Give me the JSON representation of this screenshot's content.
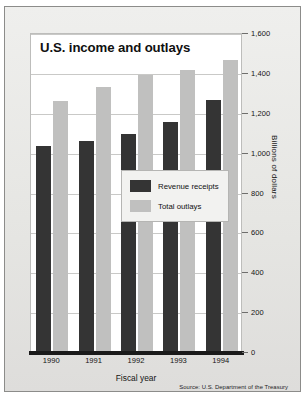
{
  "card": {
    "title": "U.S. income and outlays",
    "source_note": "Source: U.S. Department of the Treasury"
  },
  "axes": {
    "x_label": "Fiscal year",
    "y_label": "Billions of dollars",
    "y_ticks": [
      "0",
      "200",
      "400",
      "600",
      "800",
      "1,000",
      "1,200",
      "1,400",
      "1,600"
    ],
    "x_ticks": [
      "1990",
      "1991",
      "1992",
      "1993",
      "1994"
    ]
  },
  "legend": {
    "items": [
      {
        "label": "Revenue receipts",
        "color": "#343434"
      },
      {
        "label": "Total outlays",
        "color": "#c0c0bf"
      }
    ]
  },
  "chart_data": {
    "type": "bar",
    "title": "U.S. income and outlays",
    "xlabel": "Fiscal year",
    "ylabel": "Billions of dollars",
    "categories": [
      "1990",
      "1991",
      "1992",
      "1993",
      "1994"
    ],
    "series": [
      {
        "name": "Revenue receipts",
        "color": "#343434",
        "values": [
          1030,
          1055,
          1090,
          1150,
          1260
        ]
      },
      {
        "name": "Total outlays",
        "color": "#c0c0bf",
        "values": [
          1253,
          1324,
          1382,
          1409,
          1461
        ]
      }
    ],
    "ylim": [
      0,
      1600
    ],
    "ytick_step": 200,
    "grid": true,
    "legend_position": "inside-center",
    "source": "Source: U.S. Department of the Treasury"
  }
}
